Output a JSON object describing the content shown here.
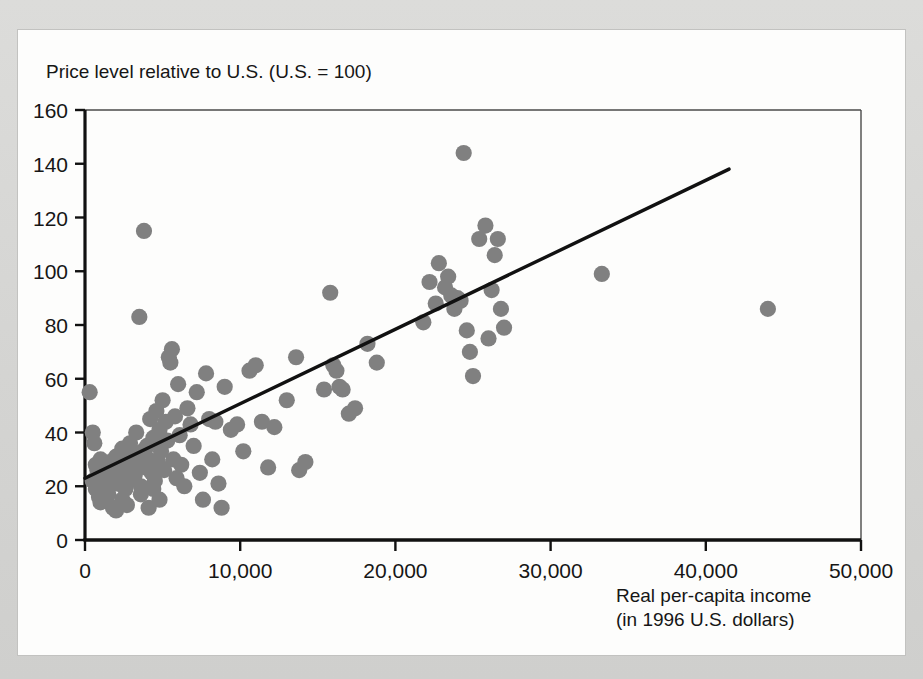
{
  "figure": {
    "background_color": "#d8d8d6",
    "card_color": "#fdfdfc"
  },
  "chart_data": {
    "type": "scatter",
    "title": "",
    "subtitle": "",
    "ylabel": "Price level relative to U.S. (U.S. = 100)",
    "xlabel_line1": "Real per-capita income",
    "xlabel_line2": "(in 1996 U.S. dollars)",
    "xlim": [
      0,
      50000
    ],
    "ylim": [
      0,
      160
    ],
    "xticks": [
      0,
      10000,
      20000,
      30000,
      40000,
      50000
    ],
    "xtick_labels": [
      "0",
      "10,000",
      "20,000",
      "30,000",
      "40,000",
      "50,000"
    ],
    "yticks": [
      0,
      20,
      40,
      60,
      80,
      100,
      120,
      140,
      160
    ],
    "ytick_labels": [
      "0",
      "20",
      "40",
      "60",
      "80",
      "100",
      "120",
      "140",
      "160"
    ],
    "grid": false,
    "legend": false,
    "marker_color": "#808080",
    "marker_size": 11,
    "line_color": "#111111",
    "trendline": {
      "label": "fitted regression line",
      "x_start": 0,
      "y_start": 23,
      "x_end": 41500,
      "y_end": 138
    },
    "points": [
      [
        300,
        55
      ],
      [
        500,
        40
      ],
      [
        600,
        36
      ],
      [
        700,
        28
      ],
      [
        800,
        26
      ],
      [
        500,
        22
      ],
      [
        900,
        24
      ],
      [
        1000,
        30
      ],
      [
        700,
        19
      ],
      [
        1100,
        21
      ],
      [
        1200,
        27
      ],
      [
        900,
        16
      ],
      [
        1300,
        23
      ],
      [
        1400,
        25
      ],
      [
        1500,
        20
      ],
      [
        1000,
        14
      ],
      [
        1600,
        29
      ],
      [
        1700,
        22
      ],
      [
        1800,
        26
      ],
      [
        1200,
        18
      ],
      [
        1900,
        24
      ],
      [
        2000,
        31
      ],
      [
        1500,
        17
      ],
      [
        2100,
        21
      ],
      [
        2200,
        27
      ],
      [
        2300,
        23
      ],
      [
        1800,
        12
      ],
      [
        2400,
        34
      ],
      [
        2500,
        25
      ],
      [
        2600,
        19
      ],
      [
        2000,
        11
      ],
      [
        2700,
        29
      ],
      [
        2800,
        22
      ],
      [
        2900,
        36
      ],
      [
        2400,
        15
      ],
      [
        3000,
        26
      ],
      [
        3100,
        31
      ],
      [
        3200,
        24
      ],
      [
        2700,
        13
      ],
      [
        3300,
        40
      ],
      [
        3400,
        28
      ],
      [
        3500,
        83
      ],
      [
        3600,
        20
      ],
      [
        3700,
        33
      ],
      [
        3800,
        115
      ],
      [
        3900,
        27
      ],
      [
        4000,
        35
      ],
      [
        4100,
        30
      ],
      [
        3600,
        17
      ],
      [
        4200,
        45
      ],
      [
        4300,
        25
      ],
      [
        4400,
        38
      ],
      [
        4100,
        12
      ],
      [
        4500,
        22
      ],
      [
        4600,
        48
      ],
      [
        4700,
        29
      ],
      [
        4800,
        41
      ],
      [
        4400,
        19
      ],
      [
        4900,
        33
      ],
      [
        5000,
        52
      ],
      [
        5100,
        26
      ],
      [
        5200,
        44
      ],
      [
        4800,
        15
      ],
      [
        5300,
        37
      ],
      [
        5400,
        68
      ],
      [
        5500,
        66
      ],
      [
        5600,
        71
      ],
      [
        5700,
        30
      ],
      [
        5800,
        46
      ],
      [
        5900,
        23
      ],
      [
        6000,
        58
      ],
      [
        6100,
        39
      ],
      [
        6200,
        28
      ],
      [
        6400,
        20
      ],
      [
        6600,
        49
      ],
      [
        6800,
        43
      ],
      [
        7000,
        35
      ],
      [
        7200,
        55
      ],
      [
        7400,
        25
      ],
      [
        7600,
        15
      ],
      [
        7800,
        62
      ],
      [
        8000,
        45
      ],
      [
        8200,
        30
      ],
      [
        8400,
        44
      ],
      [
        8600,
        21
      ],
      [
        8800,
        12
      ],
      [
        9000,
        57
      ],
      [
        9400,
        41
      ],
      [
        9800,
        43
      ],
      [
        10200,
        33
      ],
      [
        10600,
        63
      ],
      [
        11000,
        65
      ],
      [
        11400,
        44
      ],
      [
        11800,
        27
      ],
      [
        12200,
        42
      ],
      [
        13000,
        52
      ],
      [
        13600,
        68
      ],
      [
        13800,
        26
      ],
      [
        14200,
        29
      ],
      [
        15400,
        56
      ],
      [
        15800,
        92
      ],
      [
        16000,
        65
      ],
      [
        16200,
        63
      ],
      [
        16400,
        57
      ],
      [
        16600,
        56
      ],
      [
        17000,
        47
      ],
      [
        17400,
        49
      ],
      [
        18200,
        73
      ],
      [
        18800,
        66
      ],
      [
        21800,
        81
      ],
      [
        22200,
        96
      ],
      [
        22600,
        88
      ],
      [
        22800,
        103
      ],
      [
        23200,
        94
      ],
      [
        23400,
        98
      ],
      [
        23600,
        91
      ],
      [
        23800,
        86
      ],
      [
        24000,
        90
      ],
      [
        24200,
        89
      ],
      [
        24400,
        144
      ],
      [
        24600,
        78
      ],
      [
        24800,
        70
      ],
      [
        25000,
        61
      ],
      [
        25400,
        112
      ],
      [
        25800,
        117
      ],
      [
        26000,
        75
      ],
      [
        26200,
        93
      ],
      [
        26400,
        106
      ],
      [
        26600,
        112
      ],
      [
        26800,
        86
      ],
      [
        27000,
        79
      ],
      [
        33300,
        99
      ],
      [
        44000,
        86
      ]
    ]
  }
}
